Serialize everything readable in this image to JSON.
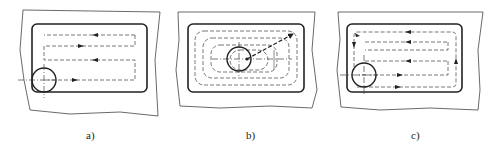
{
  "figure": {
    "panels": [
      {
        "id": "a",
        "label": "a)",
        "strategy": "zig-zag (back-and-forth) tool path"
      },
      {
        "id": "b",
        "label": "b)",
        "strategy": "spiral / contour-parallel tool path from center outward"
      },
      {
        "id": "c",
        "label": "c)",
        "strategy": "zig-zag with final contour pass"
      }
    ]
  },
  "colors": {
    "line": "#222222",
    "dashed": "#555555",
    "background": "#ffffff"
  }
}
